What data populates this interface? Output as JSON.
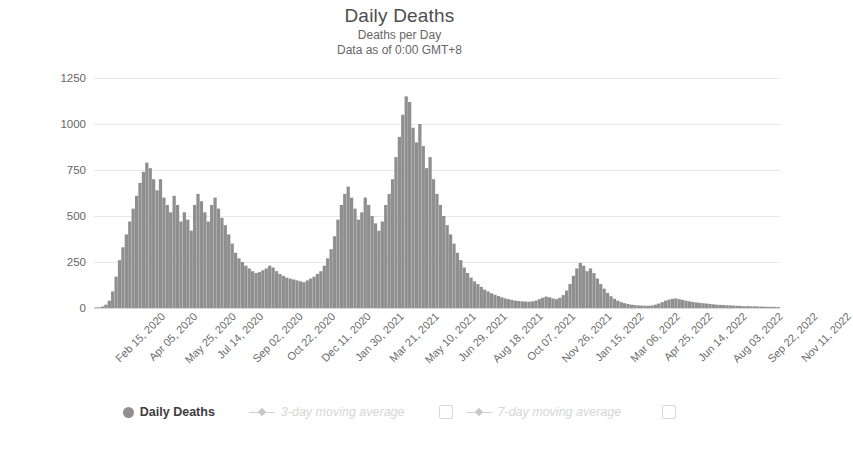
{
  "header": {
    "title": "Daily Deaths",
    "subtitle_1": "Deaths per Day",
    "subtitle_2": "Data as of 0:00 GMT+8"
  },
  "legend": {
    "items": [
      {
        "label": "Daily Deaths",
        "marker": "filled-circle",
        "state": "active",
        "checkbox": false
      },
      {
        "label": "3-day moving average",
        "marker": "line-diamond",
        "state": "disabled",
        "checkbox": false
      },
      {
        "label": "7-day moving average",
        "marker": "line-diamond",
        "state": "disabled",
        "checkbox": true
      }
    ],
    "trailing_checkbox": true
  },
  "colors": {
    "bar": "#8f8f8f",
    "grid": "#e8e8e8",
    "axis_text": "#666666",
    "title_text": "#4d4d4d",
    "muted_text": "#d6d6d6",
    "background": "#ffffff"
  },
  "chart_data": {
    "type": "bar",
    "title": "Daily Deaths",
    "subtitle": "Deaths per Day",
    "note": "Data as of 0:00 GMT+8",
    "xlabel": "",
    "ylabel": "Novel Coronavirus Daily Deaths",
    "ylim": [
      0,
      1250
    ],
    "yticks": [
      0,
      250,
      500,
      750,
      1000,
      1250
    ],
    "ytick_labels": [
      "0",
      "250",
      "500",
      "750",
      "1000",
      "1250"
    ],
    "grid": true,
    "legend_position": "bottom",
    "x_range": [
      "Feb 15, 2020",
      "Nov 11, 2022"
    ],
    "xtick_labels": [
      "Feb 15, 2020",
      "Apr 05, 2020",
      "May 25, 2020",
      "Jul 14, 2020",
      "Sep 02, 2020",
      "Oct 22, 2020",
      "Dec 11, 2020",
      "Jan 30, 2021",
      "Mar 21, 2021",
      "May 10, 2021",
      "Jun 29, 2021",
      "Aug 18, 2021",
      "Oct 07, 2021",
      "Nov 26, 2021",
      "Jan 15, 2022",
      "Mar 06, 2022",
      "Apr 25, 2022",
      "Jun 14, 2022",
      "Aug 03, 2022",
      "Sep 22, 2022",
      "Nov 11, 2022"
    ],
    "xtick_interval_days": 50,
    "series": [
      {
        "name": "Daily Deaths",
        "unit": "deaths per day",
        "sample_interval_days": 5,
        "start_date": "Feb 15, 2020",
        "peak_value": 1150,
        "peak_date": "Apr 2021",
        "values": [
          2,
          4,
          8,
          18,
          40,
          90,
          170,
          260,
          330,
          400,
          470,
          540,
          610,
          680,
          740,
          790,
          760,
          700,
          640,
          700,
          600,
          560,
          520,
          610,
          560,
          470,
          520,
          480,
          420,
          560,
          620,
          580,
          520,
          470,
          560,
          600,
          540,
          490,
          450,
          400,
          350,
          300,
          270,
          250,
          230,
          215,
          200,
          190,
          195,
          205,
          215,
          230,
          220,
          200,
          185,
          175,
          165,
          160,
          155,
          150,
          145,
          140,
          150,
          160,
          170,
          185,
          200,
          230,
          270,
          320,
          390,
          480,
          560,
          620,
          660,
          600,
          540,
          480,
          520,
          600,
          560,
          500,
          460,
          420,
          470,
          560,
          620,
          700,
          820,
          930,
          1050,
          1150,
          1120,
          980,
          900,
          1000,
          880,
          760,
          820,
          700,
          620,
          560,
          500,
          450,
          400,
          350,
          300,
          260,
          220,
          190,
          165,
          145,
          130,
          115,
          100,
          90,
          80,
          72,
          65,
          58,
          52,
          48,
          44,
          40,
          38,
          36,
          35,
          34,
          36,
          40,
          48,
          56,
          62,
          58,
          52,
          48,
          55,
          70,
          95,
          130,
          175,
          215,
          245,
          230,
          200,
          215,
          190,
          160,
          130,
          105,
          82,
          64,
          50,
          40,
          32,
          26,
          22,
          18,
          16,
          14,
          13,
          12,
          12,
          14,
          18,
          24,
          32,
          40,
          46,
          50,
          52,
          48,
          44,
          40,
          36,
          33,
          30,
          28,
          26,
          24,
          22,
          20,
          18,
          17,
          16,
          15,
          14,
          13,
          12,
          11,
          10,
          10,
          9,
          9,
          8,
          8,
          7,
          7,
          6,
          6,
          5
        ]
      }
    ]
  }
}
